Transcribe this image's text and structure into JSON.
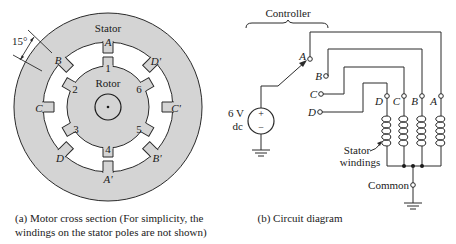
{
  "motor": {
    "stator_label": "Stator",
    "rotor_label": "Rotor",
    "angle_label": "15°",
    "stator_poles": [
      "A",
      "D'",
      "C'",
      "B'",
      "A'",
      "D",
      "C",
      "B"
    ],
    "rotor_poles": [
      "1",
      "6",
      "5",
      "4",
      "3",
      "2"
    ],
    "caption_line1": "(a)  Motor cross section (For simplicity, the",
    "caption_line2": "windings on the stator poles are not shown)"
  },
  "circuit": {
    "controller_label": "Controller",
    "source_voltage": "6 V",
    "source_type": "dc",
    "source_plus": "+",
    "source_minus": "−",
    "switch_terminals": [
      "A",
      "B",
      "C",
      "D"
    ],
    "winding_terminals": [
      "D",
      "C",
      "B",
      "A"
    ],
    "windings_label_1": "Stator",
    "windings_label_2": "windings",
    "common_label": "Common",
    "caption": "(b) Circuit diagram"
  },
  "colors": {
    "stator_fill": "#d4d4d4",
    "rotor_fill": "#d4d4d4",
    "line": "#2a2a2a",
    "background": "#ffffff"
  }
}
